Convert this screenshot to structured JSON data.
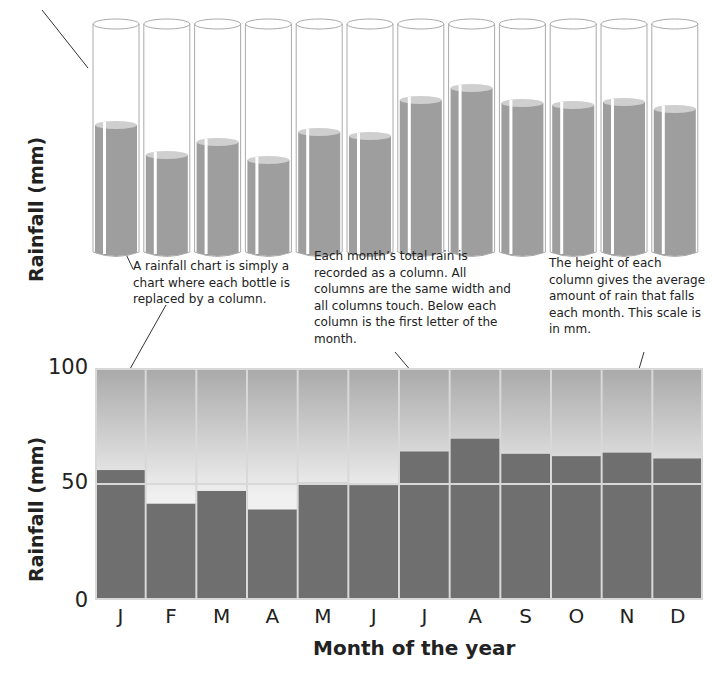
{
  "top_diagram": {
    "ylabel": "Rainfall (mm)",
    "bottle_levels_px": [
      130,
      100,
      113,
      95,
      123,
      119,
      155,
      167,
      152,
      150,
      153,
      146
    ]
  },
  "notes": [
    {
      "id": "left",
      "text": "A rainfall chart is simply a chart where each bottle is replaced by a column."
    },
    {
      "id": "middle",
      "text": "Each month’s total rain is recorded as a column. All columns are the same width and all columns touch. Below each column is the first letter of the month."
    },
    {
      "id": "right",
      "text": "The height of each column gives the average amount of rain that falls each month. This scale is in mm."
    }
  ],
  "chart_data": {
    "type": "bar",
    "title": "",
    "xlabel": "Month of the year",
    "ylabel": "Rainfall (mm)",
    "categories": [
      "J",
      "F",
      "M",
      "A",
      "M",
      "J",
      "J",
      "A",
      "S",
      "O",
      "N",
      "D"
    ],
    "values": [
      56,
      41.5,
      47,
      39,
      50.5,
      49.5,
      64,
      69.5,
      63,
      62,
      63.5,
      61
    ],
    "ylim": [
      0,
      100
    ],
    "yticks": [
      "0",
      "50",
      "100"
    ],
    "grid": true,
    "colors": {
      "bar": "#6f6f6f",
      "background_top": "#a9a9a9",
      "background_bottom": "#f0f0f0",
      "grid": "#d8d8d8"
    }
  }
}
